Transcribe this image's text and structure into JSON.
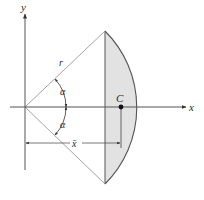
{
  "figure": {
    "labels": {
      "y_axis": "y",
      "x_axis": "x",
      "radius": "r",
      "angle_upper": "α",
      "angle_lower": "α",
      "centroid": "C",
      "xbar": "x̄"
    },
    "colors": {
      "line": "#333333",
      "axis": "#555555",
      "fill": "#e2e2e2",
      "radius_line": "#9a9a9a",
      "centroid_dot": "#111111"
    }
  }
}
